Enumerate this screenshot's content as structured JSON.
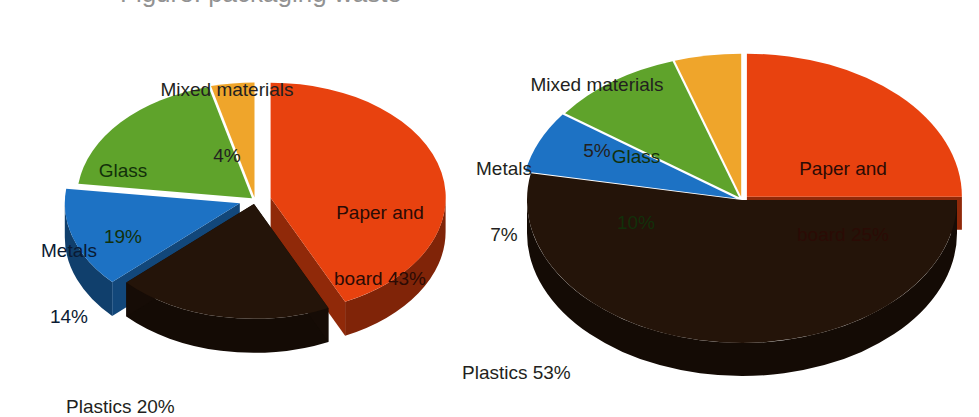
{
  "figure": {
    "background_color": "#ffffff",
    "cropped_title_fragment": "Figure: packaging waste",
    "palette": {
      "paper_and_board": "#e8420f",
      "paper_and_board_side": "#9c1c06",
      "plastics": "#241409",
      "plastics_side": "#150a04",
      "metals": "#1d72c4",
      "metals_side": "#10497f",
      "glass": "#5fa32b",
      "glass_side": "#3c6b18",
      "mixed_materials": "#efa52b",
      "mixed_materials_side": "#a87115",
      "label_text": "#231f20"
    }
  },
  "chart_data": [
    {
      "type": "pie",
      "title": "",
      "chart_id": "left-pie",
      "labels": [
        "Paper and board",
        "Plastics",
        "Metals",
        "Glass",
        "Mixed materials"
      ],
      "values": [
        43,
        20,
        14,
        19,
        4
      ],
      "unit": "%",
      "exploded": true,
      "three_d": true,
      "legend": "none",
      "data_labels": [
        "Paper and\nboard 43%",
        "Plastics 20%",
        "Metals\n14%",
        "Glass\n19%",
        "Mixed materials\n4%"
      ],
      "colors": [
        "#e8420f",
        "#241409",
        "#1d72c4",
        "#5fa32b",
        "#efa52b"
      ]
    },
    {
      "type": "pie",
      "title": "",
      "chart_id": "right-pie",
      "labels": [
        "Paper and board",
        "Plastics",
        "Metals",
        "Glass",
        "Mixed materials"
      ],
      "values": [
        25,
        53,
        7,
        10,
        5
      ],
      "unit": "%",
      "exploded": true,
      "three_d": true,
      "legend": "none",
      "data_labels": [
        "Paper and\nboard 25%",
        "Plastics 53%",
        "Metals\n7%",
        "Glass\n10%",
        "Mixed materials\n5%"
      ],
      "colors": [
        "#e8420f",
        "#241409",
        "#1d72c4",
        "#5fa32b",
        "#efa52b"
      ]
    }
  ],
  "left_chart": {
    "mixed_materials_label_line1": "Mixed materials",
    "mixed_materials_label_line2": "4%",
    "glass_label_line1": "Glass",
    "glass_label_line2": "19%",
    "metals_label_line1": "Metals",
    "metals_label_line2": "14%",
    "paper_label_line1": "Paper and",
    "paper_label_line2": "board 43%",
    "plastics_label": "Plastics 20%"
  },
  "right_chart": {
    "mixed_materials_label_line1": "Mixed materials",
    "mixed_materials_label_line2": "5%",
    "glass_label_line1": "Glass",
    "glass_label_line2": "10%",
    "metals_label_line1": "Metals",
    "metals_label_line2": "7%",
    "paper_label_line1": "Paper and",
    "paper_label_line2": "board 25%",
    "plastics_label": "Plastics 53%"
  }
}
